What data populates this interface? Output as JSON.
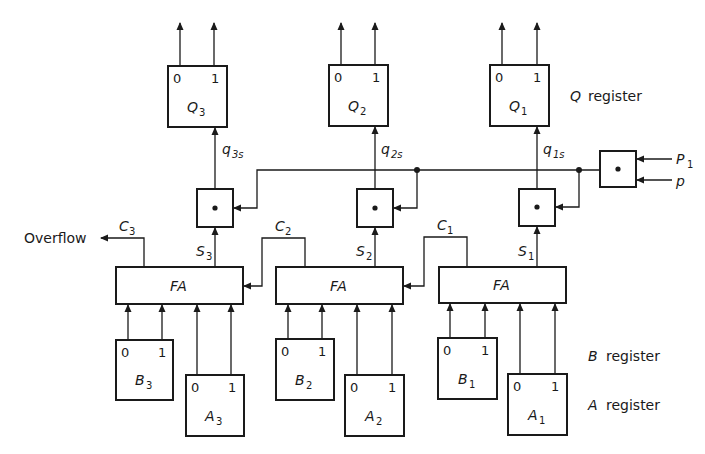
{
  "diagram": {
    "q_register": {
      "label": "register",
      "label_var": "Q",
      "cells": [
        {
          "id": "Q3",
          "name": "Q",
          "sub": "3",
          "bit0": "0",
          "bit1": "1",
          "input_signal": "q",
          "input_sub": "3s"
        },
        {
          "id": "Q2",
          "name": "Q",
          "sub": "2",
          "bit0": "0",
          "bit1": "1",
          "input_signal": "q",
          "input_sub": "2s"
        },
        {
          "id": "Q1",
          "name": "Q",
          "sub": "1",
          "bit0": "0",
          "bit1": "1",
          "input_signal": "q",
          "input_sub": "1s"
        }
      ]
    },
    "gates": [
      {
        "id": "and3",
        "glyph": "•"
      },
      {
        "id": "and2",
        "glyph": "•"
      },
      {
        "id": "and1",
        "glyph": "•"
      },
      {
        "id": "control",
        "glyph": "•",
        "inputs": [
          {
            "name": "P",
            "sub": "1"
          },
          {
            "name": "p",
            "sub": ""
          }
        ]
      }
    ],
    "adders": [
      {
        "id": "FA3",
        "label": "FA",
        "sum": "S",
        "sum_sub": "3",
        "carry": "C",
        "carry_sub": "3"
      },
      {
        "id": "FA2",
        "label": "FA",
        "sum": "S",
        "sum_sub": "2",
        "carry": "C",
        "carry_sub": "2"
      },
      {
        "id": "FA1",
        "label": "FA",
        "sum": "S",
        "sum_sub": "1",
        "carry": "C",
        "carry_sub": "1"
      }
    ],
    "overflow_label": "Overflow",
    "b_register": {
      "label": "register",
      "label_var": "B",
      "cells": [
        {
          "id": "B3",
          "name": "B",
          "sub": "3",
          "bit0": "0",
          "bit1": "1"
        },
        {
          "id": "B2",
          "name": "B",
          "sub": "2",
          "bit0": "0",
          "bit1": "1"
        },
        {
          "id": "B1",
          "name": "B",
          "sub": "1",
          "bit0": "0",
          "bit1": "1"
        }
      ]
    },
    "a_register": {
      "label": "register",
      "label_var": "A",
      "cells": [
        {
          "id": "A3",
          "name": "A",
          "sub": "3",
          "bit0": "0",
          "bit1": "1"
        },
        {
          "id": "A2",
          "name": "A",
          "sub": "2",
          "bit0": "0",
          "bit1": "1"
        },
        {
          "id": "A1",
          "name": "A",
          "sub": "1",
          "bit0": "0",
          "bit1": "1"
        }
      ]
    }
  }
}
